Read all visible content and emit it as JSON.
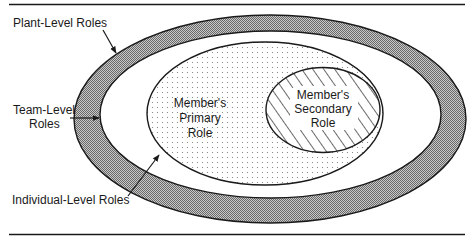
{
  "diagram": {
    "type": "nested-ellipses",
    "colors": {
      "ink": "#1a1a1a",
      "plant_band_fill": "#a9a9a9",
      "background": "#ffffff"
    },
    "regions": [
      {
        "id": "plant",
        "name": "Plant-Level Roles",
        "fill": "crosshatch-gray"
      },
      {
        "id": "team",
        "name": "Team-Level Roles",
        "fill": "white"
      },
      {
        "id": "individual",
        "name": "Individual-Level Roles",
        "fill": "dotted"
      },
      {
        "id": "secondary",
        "name": "Member's Secondary Role",
        "fill": "diagonal-hatch"
      }
    ],
    "labels": {
      "plant": "Plant-Level Roles",
      "team_line1": "Team-Level",
      "team_line2": "Roles",
      "individual": "Individual-Level Roles",
      "primary_line1": "Member's",
      "primary_line2": "Primary",
      "primary_line3": "Role",
      "secondary_line1": "Member's",
      "secondary_line2": "Secondary",
      "secondary_line3": "Role"
    }
  }
}
